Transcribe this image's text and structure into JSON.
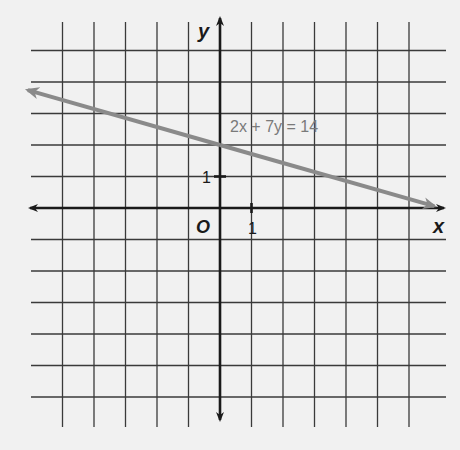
{
  "graph": {
    "x_range": [
      -5,
      6
    ],
    "y_range": [
      -6,
      5
    ],
    "x_axis_label": "x",
    "y_axis_label": "y",
    "origin_label": "O",
    "x_tick_label": "1",
    "y_tick_label": "1",
    "line": {
      "equation": "2x + 7y = 14",
      "a": 2,
      "b": 7,
      "c": 14,
      "x_from": -6.1,
      "x_to": 6.8,
      "color": "#8a8a8a"
    }
  }
}
